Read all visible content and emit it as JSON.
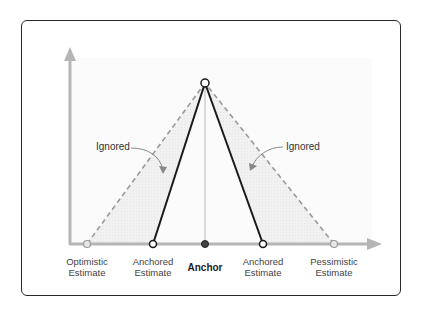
{
  "diagram": {
    "type": "anchoring-estimate-triangle",
    "colors": {
      "axis": "#b5b5b5",
      "anchored_line": "#1a1a1a",
      "ignored_dashed": "#9a9a9a",
      "shading": "#efefef",
      "anchor_point": "#444444",
      "frame": "#2a2a2a"
    },
    "points": {
      "peak": {
        "x": 205,
        "y": 83
      },
      "optimistic": {
        "x": 87,
        "y": 244
      },
      "anchored_left": {
        "x": 153,
        "y": 244
      },
      "anchor": {
        "x": 205,
        "y": 244
      },
      "anchored_right": {
        "x": 263,
        "y": 244
      },
      "pessimistic": {
        "x": 334,
        "y": 244
      }
    },
    "x_labels": [
      {
        "id": "optimistic",
        "line1": "Optimistic",
        "line2": "Estimate"
      },
      {
        "id": "anchored_left",
        "line1": "Anchored",
        "line2": "Estimate"
      },
      {
        "id": "anchor",
        "line1": "Anchor"
      },
      {
        "id": "anchored_right",
        "line1": "Anchored",
        "line2": "Estimate"
      },
      {
        "id": "pessimistic",
        "line1": "Pessimistic",
        "line2": "Estimate"
      }
    ],
    "callouts": {
      "left": "Ignored",
      "right": "Ignored"
    }
  }
}
